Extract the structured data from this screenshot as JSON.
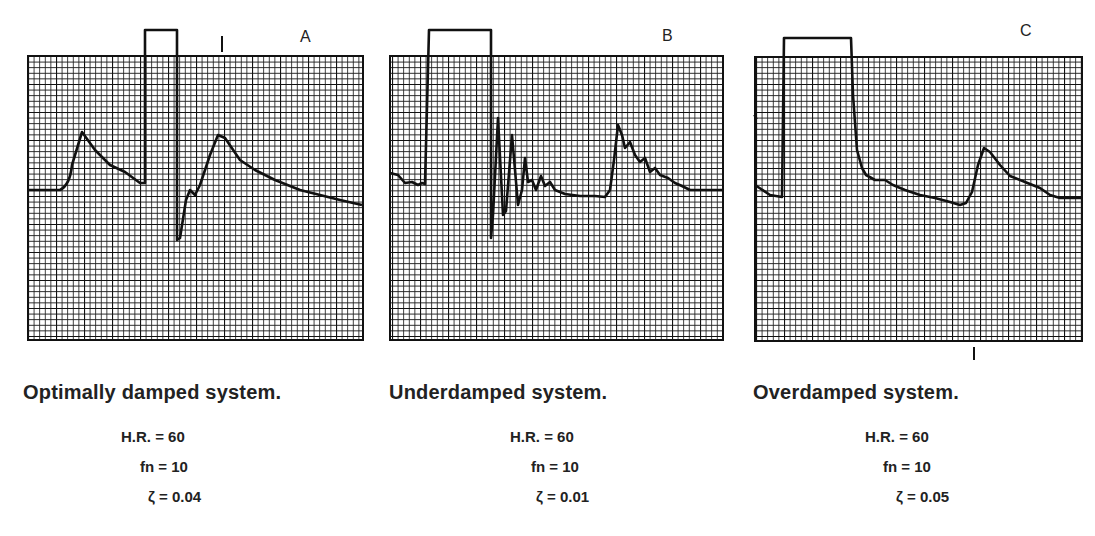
{
  "figure": {
    "panels": [
      {
        "id": "A",
        "letter": "A",
        "caption": "Optimally damped system.",
        "params": {
          "hr": "H.R. = 60",
          "fn": "fn = 10",
          "zeta": "ζ = 0.04"
        },
        "grid": {
          "x": 28,
          "y": 56,
          "w": 335,
          "h": 284
        },
        "square_wave": "M28,190 L60,190 Q70,185 72,165 L82,132 L95,150 L110,165 L125,172 L140,183 L145,183 L145,30 L177,30 L177,240 L180,238 L186,200 L190,190 L195,195 L200,185 L210,155 L218,135 L225,138 L240,160 L255,170 L275,180 L300,190 L320,195 L340,200 L362,205",
        "marker_top": {
          "x": 222,
          "y1": 36,
          "y2": 52
        },
        "marker_bottom": null
      },
      {
        "id": "B",
        "letter": "B",
        "caption": "Underdamped system.",
        "params": {
          "hr": "H.R. = 60",
          "fn": "fn = 10",
          "zeta": "ζ = 0.01"
        },
        "grid": {
          "x": 390,
          "y": 56,
          "w": 333,
          "h": 284
        },
        "square_wave": "M390,173 L398,175 L405,183 L412,182 L418,185 L422,183 L425,184 L429,30 L491,30 L491,238 L493,215 L498,118 L503,215 L506,211 L512,135 L518,205 L522,190 L525,158 L528,182 L532,180 L536,190 L541,176 L545,186 L550,182 L555,190 L565,194 L580,196 L595,196 L605,197 L610,190 L614,160 L618,125 L622,135 L625,148 L630,142 L635,155 L640,162 L645,158 L650,172 L655,168 L660,175 L668,178 L675,183 L682,186 L690,190 L722,190",
        "marker_top": null,
        "marker_bottom": null
      },
      {
        "id": "C",
        "letter": "C",
        "caption": "Overdamped system.",
        "params": {
          "hr": "H.R. = 60",
          "fn": "fn = 10",
          "zeta": "ζ = 0.05"
        },
        "grid": {
          "x": 755,
          "y": 57,
          "w": 327,
          "h": 284
        },
        "square_wave": "M755,185 L770,195 L782,197 L784,38 L851,38 L853,95 L857,150 L862,168 L866,175 L875,180 L885,180 L893,185 L905,190 L920,195 L935,198 L950,202 L960,205 L966,203 L972,192 L978,165 L984,148 L990,152 L1000,165 L1010,176 L1025,182 L1040,188 L1050,195 L1060,198 L1082,198",
        "marker_top": null,
        "marker_bottom": {
          "x": 974,
          "y1": 347,
          "y2": 360
        },
        "left_tick": {
          "x": 756,
          "y": 117
        }
      }
    ]
  },
  "chart_data": [
    {
      "type": "line",
      "title": "Optimally damped system.",
      "panel_label": "A",
      "annotations": [
        "H.R. = 60",
        "fn = 10",
        "ζ = 0.04"
      ],
      "description": "Arterial pressure waveform with square-wave flush test; single undershoot then return to baseline",
      "square_wave_test": true,
      "oscillations_after_flush": 1
    },
    {
      "type": "line",
      "title": "Underdamped system.",
      "panel_label": "B",
      "annotations": [
        "H.R. = 60",
        "fn = 10",
        "ζ = 0.01"
      ],
      "description": "Arterial pressure waveform with square-wave flush test; multiple ringing oscillations after flush",
      "square_wave_test": true,
      "oscillations_after_flush": 5
    },
    {
      "type": "line",
      "title": "Overdamped system.",
      "panel_label": "C",
      "annotations": [
        "H.R. = 60",
        "fn = 10",
        "ζ = 0.05"
      ],
      "description": "Arterial pressure waveform with square-wave flush test; slow return to baseline with no oscillation",
      "square_wave_test": true,
      "oscillations_after_flush": 0
    }
  ]
}
